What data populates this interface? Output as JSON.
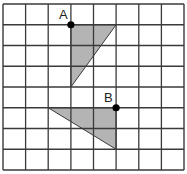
{
  "diagram": {
    "type": "grid-transformation",
    "grid": {
      "columns": 8,
      "rows": 8,
      "x_lines": [
        3,
        25.6,
        48.2,
        70.9,
        93.5,
        116.1,
        138.8,
        161.4,
        184
      ],
      "y_lines": [
        4,
        24.75,
        45.5,
        66.25,
        87,
        107.75,
        128.5,
        149.25,
        170
      ],
      "line_color": "#3a3a3a",
      "background": "#ffffff"
    },
    "shapes": [
      {
        "name": "triangle-a",
        "fill": "#b4b4b4",
        "stroke": "#3a3a3a",
        "vertices_grid": [
          [
            3,
            1
          ],
          [
            5,
            1
          ],
          [
            3,
            4
          ]
        ]
      },
      {
        "name": "triangle-b",
        "fill": "#b4b4b4",
        "stroke": "#3a3a3a",
        "vertices_grid": [
          [
            2,
            5
          ],
          [
            5,
            5
          ],
          [
            5,
            7
          ]
        ]
      }
    ],
    "points": [
      {
        "label": "A",
        "grid": [
          3,
          1
        ],
        "label_offset": [
          -12,
          -6
        ]
      },
      {
        "label": "B",
        "grid": [
          5,
          5
        ],
        "label_offset": [
          -12,
          -6
        ]
      }
    ],
    "dot_color": "#000000"
  }
}
